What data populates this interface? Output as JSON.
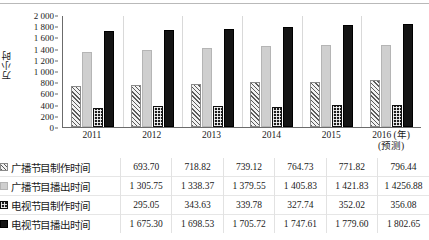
{
  "chart_data": {
    "type": "bar",
    "title": "",
    "xlabel": "(年)",
    "ylabel": "万小时",
    "ylim": [
      0,
      2000
    ],
    "ytick_step": 200,
    "yticks": [
      "0",
      "200",
      "400",
      "600",
      "800",
      "1 000",
      "1 200",
      "1 400",
      "1 600",
      "1 800",
      "2 000"
    ],
    "grid": false,
    "legend_position": "table-rowheads",
    "categories": [
      "2011",
      "2012",
      "2013",
      "2014",
      "2015",
      "2016"
    ],
    "category_sublabels": [
      "",
      "",
      "",
      "",
      "",
      "(预测)"
    ],
    "x_axis_unit": "(年)",
    "series": [
      {
        "name": "广播节目制作时间",
        "pattern": "diagonal-hatch",
        "values": [
          693.7,
          718.82,
          739.12,
          764.73,
          771.82,
          796.44
        ],
        "display": [
          "693.70",
          "718.82",
          "739.12",
          "764.73",
          "771.82",
          "796.44"
        ]
      },
      {
        "name": "广播节目播出时间",
        "pattern": "light-gray-solid",
        "values": [
          1305.75,
          1338.37,
          1379.55,
          1405.83,
          1421.83,
          1425.88
        ],
        "display": [
          "1 305.75",
          "1 338.37",
          "1 379.55",
          "1 405.83",
          "1 421.83",
          "1 4256.88"
        ]
      },
      {
        "name": "电视节目制作时间",
        "pattern": "checkered-dark",
        "values": [
          295.05,
          343.63,
          339.78,
          327.74,
          352.02,
          356.08
        ],
        "display": [
          "295.05",
          "343.63",
          "339.78",
          "327.74",
          "352.02",
          "356.08"
        ]
      },
      {
        "name": "电视节目播出时间",
        "pattern": "black-solid",
        "values": [
          1675.3,
          1698.53,
          1705.72,
          1747.61,
          1779.6,
          1802.65
        ],
        "display": [
          "1 675.30",
          "1 698.53",
          "1 705.72",
          "1 747.61",
          "1 779.60",
          "1 802.65"
        ]
      }
    ]
  }
}
